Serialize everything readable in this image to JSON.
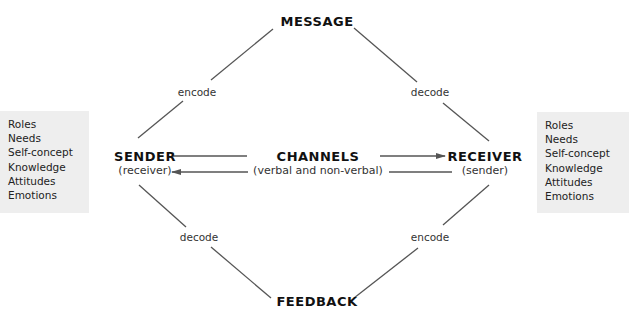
{
  "diagram": {
    "type": "communication-model",
    "nodes": {
      "message": {
        "title": "MESSAGE"
      },
      "feedback": {
        "title": "FEEDBACK"
      },
      "sender": {
        "title": "SENDER",
        "subtitle": "(receiver)"
      },
      "receiver": {
        "title": "RECEIVER",
        "subtitle": "(sender)"
      },
      "channels": {
        "title": "CHANNELS",
        "subtitle": "(verbal and non-verbal)"
      }
    },
    "edge_labels": {
      "sender_to_message": "encode",
      "message_to_receiver": "decode",
      "sender_from_feedback": "decode",
      "receiver_to_feedback": "encode"
    },
    "sender_attributes": [
      "Roles",
      "Needs",
      "Self-concept",
      "Knowledge",
      "Attitudes",
      "Emotions"
    ],
    "receiver_attributes": [
      "Roles",
      "Needs",
      "Self-concept",
      "Knowledge",
      "Attitudes",
      "Emotions"
    ],
    "colors": {
      "line": "#555555",
      "box_background": "#eeeeee",
      "text": "#1a1a1a"
    }
  }
}
